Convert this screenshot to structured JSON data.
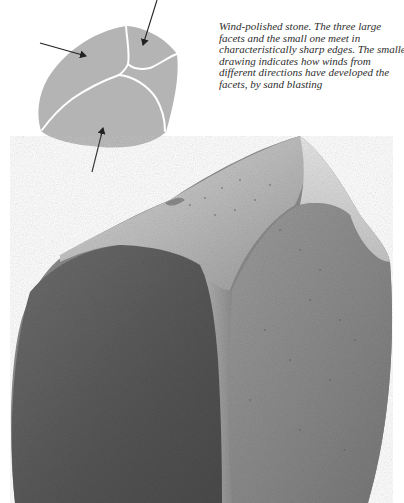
{
  "figure": {
    "diagram": {
      "label": "Wind-polished stone facet diagram",
      "fill_color": "#b4b4b4",
      "edge_color": "#ffffff",
      "arrow_color": "#222222",
      "arrows": [
        {
          "name": "wind-arrow-left",
          "from": [
            40,
            43
          ],
          "to": [
            87,
            56
          ]
        },
        {
          "name": "wind-arrow-top",
          "from": [
            157,
            0
          ],
          "to": [
            142,
            46
          ]
        },
        {
          "name": "wind-arrow-bottom",
          "from": [
            92,
            172
          ],
          "to": [
            103,
            127
          ]
        }
      ]
    },
    "caption": {
      "lines": [
        "Wind-polished stone. The three large",
        "facets and the small one meet in",
        "characteristically sharp edges. The smaller",
        "drawing indicates how winds from",
        "different directions have developed the",
        "facets, by sand blasting"
      ]
    },
    "photo": {
      "label": "Photograph of wind-polished stone (ventifact)",
      "dark_face_color": "#5a5a5a",
      "light_face_color": "#8c8c8c",
      "top_face_color": "#c8c8c8"
    }
  }
}
